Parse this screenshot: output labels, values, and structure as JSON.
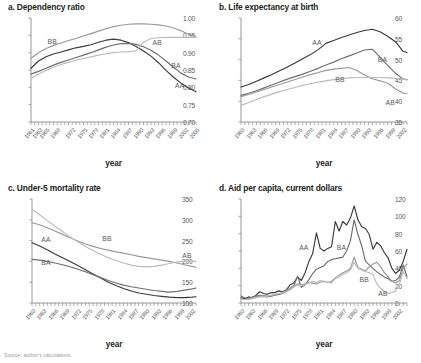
{
  "figure": {
    "axis_name": "year",
    "footnote": "Source: author's calculations.",
    "series_order": [
      "AA",
      "BA",
      "BB",
      "AB"
    ],
    "colors": {
      "AA": "#3a3a3a",
      "BA": "#6e6e6e",
      "BB": "#9a9a9a",
      "AB": "#bcbcbc"
    }
  },
  "chart_data": [
    {
      "type": "line",
      "panel": "a",
      "title": "a. Dependency ratio",
      "xlabel": "year",
      "ylabel": "",
      "ylim": [
        0.7,
        1.0
      ],
      "yticks": [
        "0.70",
        "0.75",
        "0.80",
        "0.85",
        "0.90",
        "0.95",
        "1.00"
      ],
      "ytick_values": [
        0.7,
        0.75,
        0.8,
        0.85,
        0.9,
        0.95,
        1.0
      ],
      "xlim": [
        1961,
        2005
      ],
      "xticks": [
        "1961",
        "1963",
        "1965",
        "1968",
        "1972",
        "1975",
        "1978",
        "1981",
        "1984",
        "1987",
        "1990",
        "1993",
        "1996",
        "1999",
        "2002",
        "2005"
      ],
      "xtick_values": [
        1961,
        1963,
        1965,
        1968,
        1972,
        1975,
        1978,
        1981,
        1984,
        1987,
        1990,
        1993,
        1996,
        1999,
        2002,
        2005
      ],
      "grid": false,
      "legend": "inline",
      "annotations": [
        {
          "text": "BB",
          "x": 1967,
          "y": 0.932
        },
        {
          "text": "AB",
          "x": 1995,
          "y": 0.928
        },
        {
          "text": "BA",
          "x": 2000,
          "y": 0.862
        },
        {
          "text": "AA",
          "x": 2001,
          "y": 0.805
        }
      ],
      "x": [
        1961,
        1963,
        1965,
        1967,
        1969,
        1971,
        1973,
        1975,
        1977,
        1979,
        1981,
        1983,
        1985,
        1987,
        1989,
        1991,
        1993,
        1995,
        1997,
        1999,
        2001,
        2003,
        2005
      ],
      "series": [
        {
          "name": "AA",
          "values": [
            0.855,
            0.876,
            0.888,
            0.896,
            0.902,
            0.908,
            0.914,
            0.918,
            0.923,
            0.93,
            0.936,
            0.939,
            0.936,
            0.929,
            0.918,
            0.905,
            0.89,
            0.871,
            0.849,
            0.829,
            0.812,
            0.798,
            0.787
          ]
        },
        {
          "name": "BA",
          "values": [
            0.838,
            0.846,
            0.855,
            0.864,
            0.872,
            0.879,
            0.886,
            0.893,
            0.9,
            0.908,
            0.916,
            0.922,
            0.926,
            0.927,
            0.924,
            0.917,
            0.907,
            0.893,
            0.876,
            0.858,
            0.841,
            0.83,
            0.824
          ]
        },
        {
          "name": "BB",
          "values": [
            0.884,
            0.9,
            0.912,
            0.921,
            0.928,
            0.935,
            0.941,
            0.948,
            0.955,
            0.962,
            0.969,
            0.975,
            0.979,
            0.982,
            0.983,
            0.983,
            0.982,
            0.98,
            0.977,
            0.971,
            0.963,
            0.953,
            0.945
          ]
        },
        {
          "name": "AB",
          "values": [
            0.826,
            0.838,
            0.849,
            0.858,
            0.866,
            0.872,
            0.878,
            0.883,
            0.888,
            0.893,
            0.897,
            0.9,
            0.902,
            0.903,
            0.905,
            0.93,
            0.941,
            0.943,
            0.944,
            0.944,
            0.944,
            0.944,
            0.944
          ]
        }
      ]
    },
    {
      "type": "line",
      "panel": "b",
      "title": "b. Life expectancy at birth",
      "xlabel": "year",
      "ylabel": "",
      "ylim": [
        35,
        60
      ],
      "yticks": [
        "35",
        "40",
        "45",
        "50",
        "55",
        "60"
      ],
      "ytick_values": [
        35,
        40,
        45,
        50,
        55,
        60
      ],
      "xlim": [
        1960,
        2003
      ],
      "xticks": [
        "1960",
        "1963",
        "1966",
        "1969",
        "1972",
        "1975",
        "1978",
        "1981",
        "1984",
        "1987",
        "1990",
        "1993",
        "1996",
        "1999",
        "2002"
      ],
      "xtick_values": [
        1960,
        1963,
        1966,
        1969,
        1972,
        1975,
        1978,
        1981,
        1984,
        1987,
        1990,
        1993,
        1996,
        1999,
        2002
      ],
      "grid": false,
      "legend": "inline",
      "annotations": [
        {
          "text": "AA",
          "x": 1980,
          "y": 54.1
        },
        {
          "text": "BA",
          "x": 1997,
          "y": 50.0
        },
        {
          "text": "BB",
          "x": 1986,
          "y": 45.2
        },
        {
          "text": "AB",
          "x": 1999,
          "y": 39.6
        }
      ],
      "x": [
        1960,
        1962,
        1964,
        1966,
        1968,
        1970,
        1972,
        1974,
        1976,
        1978,
        1980,
        1982,
        1984,
        1986,
        1988,
        1990,
        1992,
        1994,
        1996,
        1998,
        2000,
        2002,
        2003
      ],
      "series": [
        {
          "name": "AA",
          "values": [
            43.4,
            44.0,
            44.8,
            45.6,
            46.4,
            47.3,
            48.2,
            49.2,
            50.2,
            51.2,
            52.4,
            53.9,
            54.6,
            55.3,
            55.9,
            56.5,
            57.0,
            57.3,
            56.7,
            55.6,
            54.3,
            52.0,
            51.7
          ]
        },
        {
          "name": "BA",
          "values": [
            41.4,
            41.9,
            42.5,
            43.2,
            43.9,
            44.6,
            45.3,
            45.9,
            46.5,
            47.2,
            47.9,
            48.7,
            49.4,
            50.2,
            50.9,
            51.6,
            52.3,
            52.5,
            50.6,
            48.6,
            46.7,
            45.3,
            45.2
          ]
        },
        {
          "name": "BB",
          "values": [
            41.1,
            41.6,
            42.2,
            42.8,
            43.4,
            44.0,
            44.6,
            45.2,
            45.8,
            46.4,
            46.9,
            47.4,
            47.7,
            47.9,
            48.1,
            47.4,
            46.3,
            45.4,
            44.9,
            44.3,
            43.0,
            41.9,
            41.8
          ]
        },
        {
          "name": "AB",
          "values": [
            39.0,
            39.7,
            40.4,
            41.1,
            41.7,
            42.3,
            42.8,
            43.3,
            43.8,
            44.2,
            44.6,
            44.9,
            45.2,
            45.4,
            45.6,
            45.7,
            45.7,
            45.7,
            45.7,
            45.6,
            45.5,
            45.3,
            45.1
          ]
        }
      ]
    },
    {
      "type": "line",
      "panel": "c",
      "title": "c. Under-5 mortality rate",
      "xlabel": "year",
      "ylabel": "",
      "ylim": [
        100,
        350
      ],
      "yticks": [
        "100",
        "150",
        "200",
        "250",
        "300",
        "350"
      ],
      "ytick_values": [
        100,
        150,
        200,
        250,
        300,
        350
      ],
      "xlim": [
        1960,
        2003
      ],
      "xticks": [
        "1960",
        "1963",
        "1966",
        "1969",
        "1972",
        "1975",
        "1978",
        "1981",
        "1984",
        "1987",
        "1990",
        "1993",
        "1996",
        "1999",
        "2002"
      ],
      "xtick_values": [
        1960,
        1963,
        1966,
        1969,
        1972,
        1975,
        1978,
        1981,
        1984,
        1987,
        1990,
        1993,
        1996,
        1999,
        2002
      ],
      "grid": false,
      "legend": "inline",
      "annotations": [
        {
          "text": "AA",
          "x": 1964,
          "y": 252
        },
        {
          "text": "BB",
          "x": 1980,
          "y": 253
        },
        {
          "text": "BA",
          "x": 1964,
          "y": 196
        },
        {
          "text": "AB",
          "x": 2001,
          "y": 212
        }
      ],
      "x": [
        1960,
        1962,
        1964,
        1966,
        1968,
        1970,
        1972,
        1974,
        1976,
        1978,
        1980,
        1982,
        1984,
        1986,
        1988,
        1990,
        1992,
        1994,
        1996,
        1998,
        2000,
        2002,
        2003
      ],
      "series": [
        {
          "name": "AA",
          "values": [
            245,
            237,
            228,
            218,
            209,
            200,
            190,
            180,
            170,
            160,
            150,
            142,
            135,
            129,
            124,
            121,
            118,
            116,
            114,
            113,
            113,
            114,
            115
          ]
        },
        {
          "name": "BA",
          "values": [
            205,
            203,
            200,
            196,
            192,
            187,
            181,
            175,
            168,
            161,
            154,
            148,
            143,
            139,
            136,
            133,
            130,
            128,
            126,
            128,
            131,
            134,
            136
          ]
        },
        {
          "name": "BB",
          "values": [
            293,
            288,
            281,
            273,
            265,
            257,
            249,
            242,
            236,
            231,
            227,
            223,
            220,
            216,
            212,
            209,
            206,
            203,
            200,
            196,
            192,
            188,
            186
          ]
        },
        {
          "name": "AB",
          "values": [
            325,
            312,
            298,
            285,
            272,
            259,
            247,
            236,
            226,
            217,
            209,
            202,
            196,
            191,
            188,
            187,
            188,
            191,
            195,
            199,
            201,
            200,
            200
          ]
        }
      ]
    },
    {
      "type": "line",
      "panel": "d",
      "title": "d. Aid per capita, current dollars",
      "xlabel": "year",
      "ylabel": "",
      "ylim": [
        0,
        120
      ],
      "yticks": [
        "0",
        "20",
        "40",
        "60",
        "80",
        "100",
        "120"
      ],
      "ytick_values": [
        0,
        20,
        40,
        60,
        80,
        100,
        120
      ],
      "xlim": [
        1960,
        2004
      ],
      "xticks": [
        "1960",
        "1963",
        "1966",
        "1969",
        "1972",
        "1975",
        "1978",
        "1981",
        "1984",
        "1987",
        "1990",
        "1993",
        "1996",
        "1999",
        "2002"
      ],
      "xtick_values": [
        1960,
        1963,
        1966,
        1969,
        1972,
        1975,
        1978,
        1981,
        1984,
        1987,
        1990,
        1993,
        1996,
        1999,
        2002
      ],
      "grid": false,
      "legend": "inline",
      "annotations": [
        {
          "text": "AA",
          "x": 1977,
          "y": 63
        },
        {
          "text": "BA",
          "x": 1987,
          "y": 63
        },
        {
          "text": "BB",
          "x": 1993,
          "y": 26
        },
        {
          "text": "AB",
          "x": 1998,
          "y": 10
        }
      ],
      "x": [
        1960,
        1961,
        1962,
        1963,
        1964,
        1965,
        1966,
        1967,
        1968,
        1969,
        1970,
        1971,
        1972,
        1973,
        1974,
        1975,
        1976,
        1977,
        1978,
        1979,
        1980,
        1981,
        1982,
        1983,
        1984,
        1985,
        1986,
        1987,
        1988,
        1989,
        1990,
        1991,
        1992,
        1993,
        1994,
        1995,
        1996,
        1997,
        1998,
        1999,
        2000,
        2001,
        2002,
        2003,
        2004
      ],
      "series": [
        {
          "name": "AA",
          "values": [
            6,
            5,
            7,
            6,
            9,
            13,
            11,
            10,
            12,
            12,
            14,
            13,
            15,
            21,
            23,
            30,
            26,
            35,
            48,
            57,
            81,
            63,
            60,
            63,
            65,
            94,
            83,
            94,
            90,
            98,
            112,
            96,
            88,
            86,
            79,
            62,
            70,
            66,
            58,
            52,
            40,
            34,
            38,
            48,
            62
          ]
        },
        {
          "name": "BA",
          "values": [
            8,
            6,
            5,
            7,
            8,
            9,
            8,
            7,
            8,
            9,
            10,
            11,
            13,
            17,
            20,
            31,
            18,
            21,
            27,
            34,
            39,
            41,
            43,
            48,
            50,
            51,
            52,
            53,
            60,
            72,
            96,
            79,
            66,
            48,
            44,
            40,
            36,
            33,
            30,
            28,
            25,
            26,
            30,
            44,
            30
          ]
        },
        {
          "name": "BB",
          "values": [
            5,
            4,
            5,
            6,
            7,
            8,
            9,
            8,
            9,
            10,
            11,
            12,
            14,
            17,
            20,
            22,
            21,
            22,
            24,
            23,
            22,
            24,
            25,
            24,
            25,
            29,
            32,
            35,
            37,
            40,
            53,
            41,
            39,
            37,
            42,
            45,
            47,
            42,
            35,
            30,
            25,
            23,
            26,
            40,
            45
          ]
        },
        {
          "name": "AB",
          "values": [
            4,
            4,
            4,
            5,
            6,
            7,
            7,
            8,
            9,
            10,
            11,
            12,
            13,
            15,
            18,
            21,
            20,
            21,
            23,
            25,
            24,
            26,
            25,
            24,
            23,
            28,
            30,
            33,
            35,
            38,
            47,
            40,
            38,
            36,
            35,
            33,
            22,
            17,
            13,
            11,
            12,
            14,
            22,
            36,
            28
          ]
        }
      ]
    }
  ]
}
